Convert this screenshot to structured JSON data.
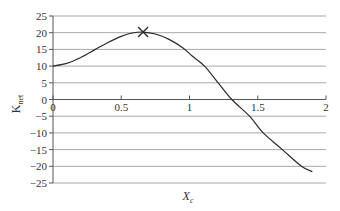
{
  "chart_data": {
    "type": "line",
    "title": "",
    "xlabel": "X",
    "xlabel_subscript": "c",
    "ylabel": "K",
    "ylabel_subscript": "net",
    "xlim": [
      0,
      2
    ],
    "ylim": [
      -25,
      25
    ],
    "x_ticks": [
      0,
      0.5,
      1,
      1.5,
      2
    ],
    "x_tick_labels": [
      "0",
      "0.5",
      "1",
      "1.5",
      "2"
    ],
    "y_ticks": [
      25,
      20,
      15,
      10,
      5,
      0,
      -5,
      -10,
      -15,
      -20,
      -25
    ],
    "y_tick_labels": [
      "25",
      "20",
      "15",
      "10",
      "5",
      "0",
      "−5",
      "−10",
      "−15",
      "−20",
      "−25"
    ],
    "grid": true,
    "legend": null,
    "series": [
      {
        "name": "K_net vs X_c",
        "x": [
          0,
          0.1,
          0.2,
          0.31,
          0.4,
          0.5,
          0.58,
          0.66,
          0.75,
          0.85,
          0.95,
          1.02,
          1.11,
          1.21,
          1.31,
          1.44,
          1.54,
          1.68,
          1.82,
          1.9
        ],
        "y": [
          10,
          10.8,
          12.5,
          15,
          17,
          18.9,
          19.9,
          20.2,
          19.6,
          18,
          15.5,
          13,
          10,
          5,
          0,
          -5,
          -10,
          -15,
          -20,
          -21.6
        ]
      }
    ],
    "annotations": [
      {
        "type": "x-marker",
        "label": "maximum",
        "x": 0.66,
        "y": 20.2
      }
    ]
  }
}
